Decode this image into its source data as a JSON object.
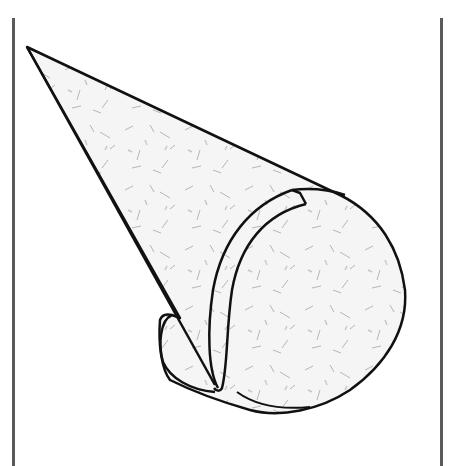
{
  "figure": {
    "colors": {
      "outline": "#111111",
      "paper_fill": "#f4f4f4",
      "fiber": "#9a9a9a",
      "frame": "#5a5a5a",
      "background": "#ffffff"
    }
  }
}
